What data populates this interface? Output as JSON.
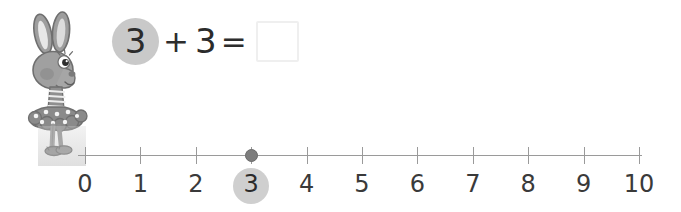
{
  "equation": {
    "addend1": "3",
    "operator": "+",
    "addend2": "3",
    "equals": "=",
    "answer_value": "",
    "answer_placeholder": ""
  },
  "numberline": {
    "min": 0,
    "max": 10,
    "step": 1,
    "tick_labels": [
      "0",
      "1",
      "2",
      "3",
      "4",
      "5",
      "6",
      "7",
      "8",
      "9",
      "10"
    ],
    "marker_position": "3",
    "highlighted_label": "3",
    "axis_color": "#9a9a9a",
    "marker_color": "#7d7d7d",
    "highlight_color": "#cfcfcf"
  },
  "character": {
    "name": "bunny-ballerina",
    "body_color": "#9e9e9e",
    "outline_color": "#6f6f6f",
    "ear_inner_color": "#e6e6e6",
    "dress_color": "#8c8c8c",
    "dot_color": "#f2f2f2"
  },
  "colors": {
    "background": "#ffffff",
    "text": "#2b2b2b",
    "answer_box_border": "#efefef"
  }
}
